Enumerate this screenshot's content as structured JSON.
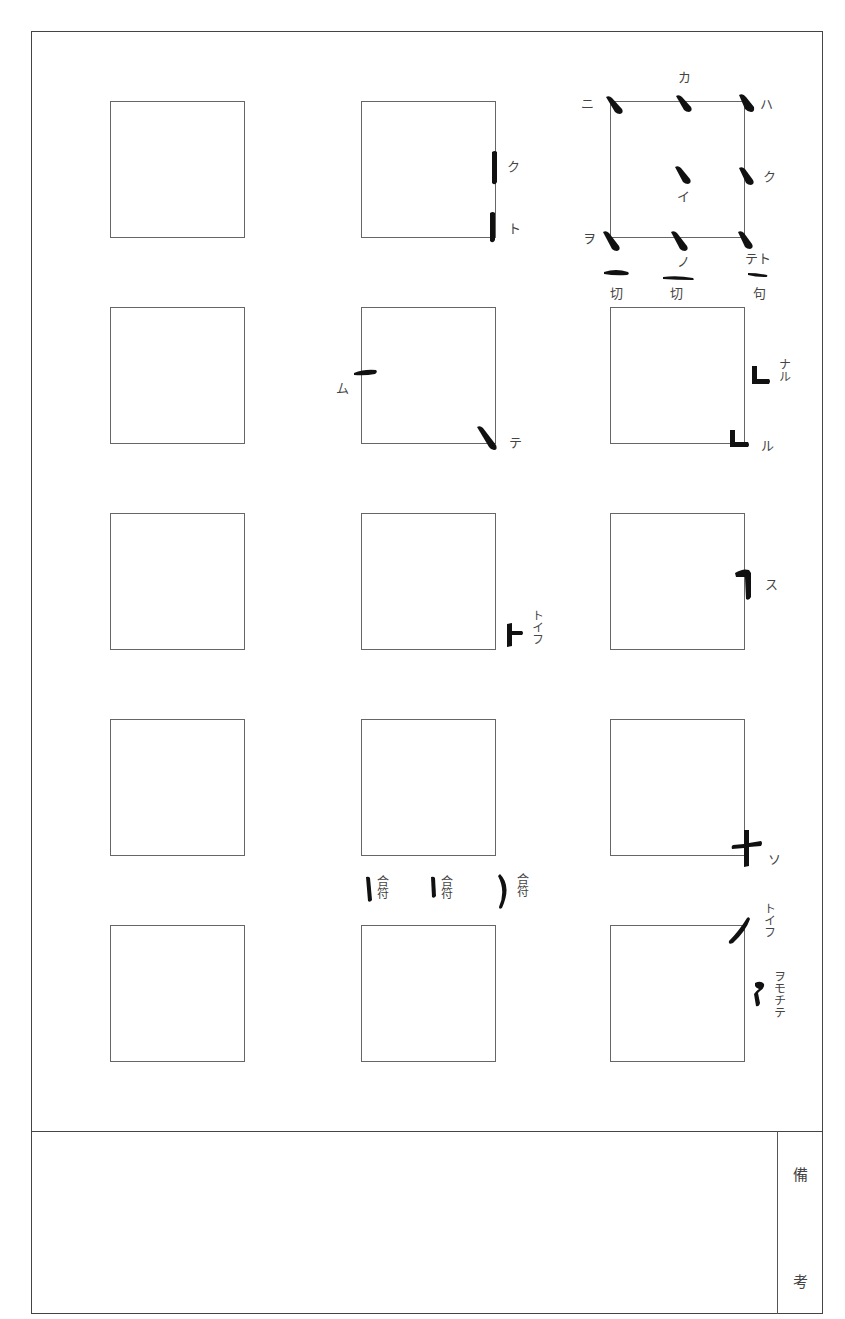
{
  "sheet": {
    "type": "calligraphy stroke reference sheet",
    "grid": {
      "rows": 5,
      "columns": 3
    },
    "remarks_label_top": "備",
    "remarks_label_bottom": "考"
  },
  "labels": {
    "ka": "カ",
    "ni": "ニ",
    "ha": "ハ",
    "ku_center": "イ",
    "ku_right": "ク",
    "wo": "ヲ",
    "no": "ノ",
    "teto": "テト",
    "setsu1": "切",
    "setsu2": "切",
    "ku_phrase": "句",
    "b1_ku": "ク",
    "b1_to": "ト",
    "b2_mu": "ム",
    "b2_te": "テ",
    "b3_naru": "ナル",
    "b3_ru": "ル",
    "c2_toifu": "トイフ",
    "c3_su": "ス",
    "d3_so": "ソ",
    "gofu": [
      "合符",
      "合符",
      "合符"
    ],
    "e3_toifu": "トイフ",
    "e3_womochite": "ヲモチテ"
  },
  "colors": {
    "ink": "#111111",
    "line": "#666666",
    "frame": "#444444",
    "text": "#444444"
  }
}
